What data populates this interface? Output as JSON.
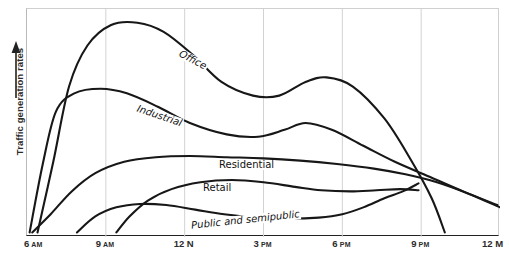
{
  "chart_data": {
    "type": "line",
    "title": "",
    "xlabel": "",
    "ylabel": "Traffic generation rates",
    "ylabel_arrow": "up-arrow",
    "grid": true,
    "grid_axis": "x",
    "legend": "inline-curve-labels",
    "xlim": [
      6,
      24
    ],
    "ylim": [
      0,
      1
    ],
    "x_tick_labels": [
      "6 AM",
      "9 AM",
      "12 N",
      "3 PM",
      "6 PM",
      "9 PM",
      "12 M"
    ],
    "x_tick_values": [
      6,
      9,
      12,
      15,
      18,
      21,
      24
    ],
    "y_tick_labels": [],
    "series": [
      {
        "name": "Office",
        "label": "Office",
        "points": [
          {
            "x": 6.4,
            "y": 0.02
          },
          {
            "x": 7.0,
            "y": 0.33
          },
          {
            "x": 7.6,
            "y": 0.66
          },
          {
            "x": 8.3,
            "y": 0.84
          },
          {
            "x": 9.2,
            "y": 0.93
          },
          {
            "x": 10.2,
            "y": 0.94
          },
          {
            "x": 11.2,
            "y": 0.9
          },
          {
            "x": 12.3,
            "y": 0.8
          },
          {
            "x": 13.4,
            "y": 0.68
          },
          {
            "x": 14.6,
            "y": 0.62
          },
          {
            "x": 15.6,
            "y": 0.62
          },
          {
            "x": 16.6,
            "y": 0.68
          },
          {
            "x": 17.4,
            "y": 0.7
          },
          {
            "x": 18.4,
            "y": 0.66
          },
          {
            "x": 19.6,
            "y": 0.52
          },
          {
            "x": 20.6,
            "y": 0.34
          },
          {
            "x": 21.4,
            "y": 0.17
          },
          {
            "x": 21.9,
            "y": 0.02
          }
        ]
      },
      {
        "name": "Industrial",
        "label": "Industrial",
        "points": [
          {
            "x": 6.1,
            "y": 0.02
          },
          {
            "x": 6.6,
            "y": 0.32
          },
          {
            "x": 7.1,
            "y": 0.55
          },
          {
            "x": 7.8,
            "y": 0.63
          },
          {
            "x": 8.8,
            "y": 0.65
          },
          {
            "x": 9.8,
            "y": 0.63
          },
          {
            "x": 11.0,
            "y": 0.57
          },
          {
            "x": 12.2,
            "y": 0.5
          },
          {
            "x": 13.6,
            "y": 0.45
          },
          {
            "x": 14.8,
            "y": 0.44
          },
          {
            "x": 15.8,
            "y": 0.47
          },
          {
            "x": 16.6,
            "y": 0.5
          },
          {
            "x": 17.6,
            "y": 0.47
          },
          {
            "x": 18.8,
            "y": 0.4
          },
          {
            "x": 20.0,
            "y": 0.33
          },
          {
            "x": 21.4,
            "y": 0.26
          },
          {
            "x": 22.6,
            "y": 0.2
          },
          {
            "x": 23.9,
            "y": 0.14
          }
        ]
      },
      {
        "name": "Residential",
        "label": "Residential",
        "points": [
          {
            "x": 6.2,
            "y": 0.02
          },
          {
            "x": 6.9,
            "y": 0.1
          },
          {
            "x": 7.7,
            "y": 0.2
          },
          {
            "x": 8.6,
            "y": 0.28
          },
          {
            "x": 9.7,
            "y": 0.33
          },
          {
            "x": 10.9,
            "y": 0.35
          },
          {
            "x": 12.2,
            "y": 0.355
          },
          {
            "x": 13.6,
            "y": 0.35
          },
          {
            "x": 15.0,
            "y": 0.345
          },
          {
            "x": 16.4,
            "y": 0.335
          },
          {
            "x": 17.8,
            "y": 0.32
          },
          {
            "x": 19.2,
            "y": 0.3
          },
          {
            "x": 20.4,
            "y": 0.275
          },
          {
            "x": 21.6,
            "y": 0.24
          },
          {
            "x": 22.8,
            "y": 0.19
          },
          {
            "x": 24.0,
            "y": 0.13
          }
        ]
      },
      {
        "name": "Retail",
        "label": "Retail",
        "points": [
          {
            "x": 9.4,
            "y": 0.02
          },
          {
            "x": 9.9,
            "y": 0.09
          },
          {
            "x": 10.6,
            "y": 0.16
          },
          {
            "x": 11.5,
            "y": 0.21
          },
          {
            "x": 12.6,
            "y": 0.24
          },
          {
            "x": 13.8,
            "y": 0.25
          },
          {
            "x": 15.0,
            "y": 0.24
          },
          {
            "x": 16.2,
            "y": 0.22
          },
          {
            "x": 17.2,
            "y": 0.205
          },
          {
            "x": 18.3,
            "y": 0.2
          },
          {
            "x": 19.3,
            "y": 0.205
          },
          {
            "x": 20.2,
            "y": 0.21
          },
          {
            "x": 20.9,
            "y": 0.205
          }
        ]
      },
      {
        "name": "Public and semipublic",
        "label": "Public and semipublic",
        "points": [
          {
            "x": 7.9,
            "y": 0.02
          },
          {
            "x": 8.6,
            "y": 0.09
          },
          {
            "x": 9.4,
            "y": 0.13
          },
          {
            "x": 10.3,
            "y": 0.145
          },
          {
            "x": 11.3,
            "y": 0.14
          },
          {
            "x": 12.4,
            "y": 0.12
          },
          {
            "x": 13.5,
            "y": 0.1
          },
          {
            "x": 14.8,
            "y": 0.085
          },
          {
            "x": 16.0,
            "y": 0.08
          },
          {
            "x": 17.1,
            "y": 0.085
          },
          {
            "x": 18.0,
            "y": 0.1
          },
          {
            "x": 18.8,
            "y": 0.13
          },
          {
            "x": 19.6,
            "y": 0.17
          },
          {
            "x": 20.3,
            "y": 0.2
          },
          {
            "x": 20.9,
            "y": 0.235
          }
        ]
      }
    ]
  },
  "axis": {
    "y_caption": "Traffic generation rates",
    "ticks": [
      {
        "num": "6",
        "suffix": "AM",
        "suffix_style": "small"
      },
      {
        "num": "9",
        "suffix": "AM",
        "suffix_style": "small"
      },
      {
        "num": "12",
        "suffix": "N",
        "suffix_style": "big"
      },
      {
        "num": "3",
        "suffix": "PM",
        "suffix_style": "small"
      },
      {
        "num": "6",
        "suffix": "PM",
        "suffix_style": "small"
      },
      {
        "num": "9",
        "suffix": "PM",
        "suffix_style": "small"
      },
      {
        "num": "12",
        "suffix": "M",
        "suffix_style": "big"
      }
    ]
  },
  "curve_labels": {
    "office": "Office",
    "industrial": "Industrial",
    "residential": "Residential",
    "retail": "Retail",
    "public": "Public and semipublic"
  }
}
